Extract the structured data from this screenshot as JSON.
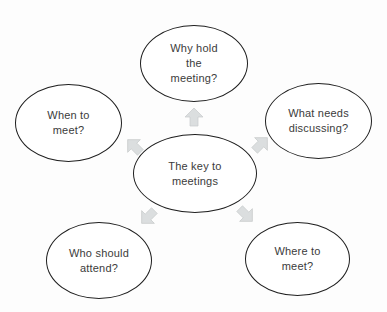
{
  "diagram": {
    "type": "radial-cycle",
    "center": {
      "label": "The key to\nmeetings"
    },
    "nodes": {
      "top": {
        "label": "Why hold\nthe\nmeeting?"
      },
      "right": {
        "label": "What needs\ndiscussing?"
      },
      "left": {
        "label": "When to\nmeet?"
      },
      "bottom_left": {
        "label": "Who should\nattend?"
      },
      "bottom_right": {
        "label": "Where to\nmeet?"
      }
    },
    "arrows": [
      "up",
      "up-left",
      "up-right",
      "down-left",
      "down-right"
    ],
    "colors": {
      "background": "#fdfdfd",
      "ellipse_fill": "#ffffff",
      "ellipse_stroke": "#1f1f1f",
      "arrow_fill": "#dbdedf",
      "arrow_stroke": "#c9cccd",
      "text": "#3b3b3b"
    }
  }
}
